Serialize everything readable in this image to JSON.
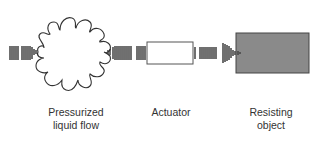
{
  "diagram": {
    "components": [
      {
        "id": "flow",
        "label_line1": "Pressurized",
        "label_line2": "liquid flow"
      },
      {
        "id": "actuator",
        "label_line1": "Actuator"
      },
      {
        "id": "object",
        "label_line1": "Resisting",
        "label_line2": "object"
      }
    ],
    "colors": {
      "stroke": "#333333",
      "object_fill": "#8a8a8a",
      "actuator_fill": "#ffffff"
    }
  }
}
